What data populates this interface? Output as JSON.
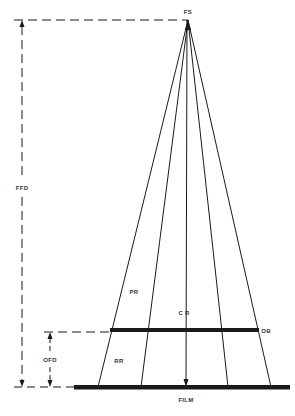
{
  "diagram": {
    "type": "x-ray projection geometry",
    "labels": {
      "focal_spot": "FS",
      "ffd": "FFD",
      "primary_ray": "PR",
      "central_ray": "C R",
      "object": "OB",
      "ofd": "OFD",
      "remnant_ray": "RR",
      "film": "FILM"
    },
    "colors": {
      "line": "#1a1a1a",
      "label": "#333333",
      "background": "#ffffff"
    },
    "geometry": {
      "focal_spot": [
        188,
        20
      ],
      "object_plane_y": 330,
      "film_plane_y": 387,
      "ray_endpoints_x": [
        98,
        141,
        186,
        228,
        271
      ]
    }
  }
}
